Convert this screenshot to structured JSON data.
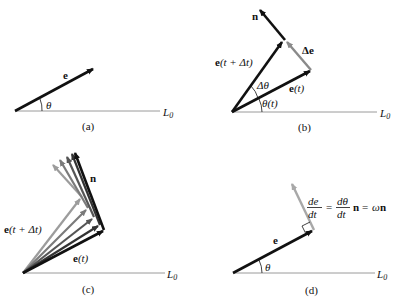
{
  "colors": {
    "primary_vector": "#111111",
    "delta_vector": "#8a8a8a",
    "baseline": "#9a9a9a",
    "fan": [
      "#9c9c9c",
      "#7a7a7a",
      "#555555",
      "#333333",
      "#111111"
    ]
  },
  "panels": [
    {
      "id": "a",
      "caption": "(a)",
      "labels": {
        "vector": "e",
        "angle": "θ",
        "baseline": "L",
        "baseline_sub": "0"
      }
    },
    {
      "id": "b",
      "caption": "(b)",
      "labels": {
        "normal": "n",
        "delta_e": "Δe",
        "e_next_bold": "e",
        "e_next_rest": "(t + Δt)",
        "delta_theta": "Δθ",
        "e_now_bold": "e",
        "e_now_rest": "(t)",
        "theta_t": "θ(t)",
        "baseline": "L",
        "baseline_sub": "0"
      }
    },
    {
      "id": "c",
      "caption": "(c)",
      "labels": {
        "normal": "n",
        "e_next_bold": "e",
        "e_next_rest": "(t + Δt)",
        "e_now_bold": "e",
        "e_now_rest": "(t)",
        "baseline": "L",
        "baseline_sub": "0"
      }
    },
    {
      "id": "d",
      "caption": "(d)",
      "labels": {
        "vector": "e",
        "angle": "θ",
        "baseline": "L",
        "baseline_sub": "0",
        "eq_lhs_num": "de",
        "eq_lhs_den": "dt",
        "eq_eq1": "=",
        "eq_mid_num": "dθ",
        "eq_mid_den": "dt",
        "eq_n": "n",
        "eq_eq2": "=",
        "eq_omega": "ω",
        "eq_n2": "n"
      }
    }
  ]
}
